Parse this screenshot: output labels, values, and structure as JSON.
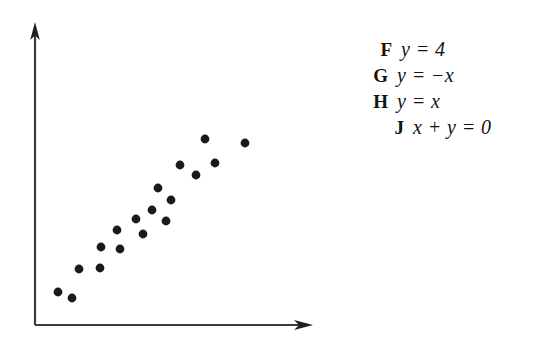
{
  "question": {
    "figure_label": "scatterplot-of-positively-correlated-data"
  },
  "choices": [
    {
      "letter": "F",
      "expression": "y = 4",
      "name": "choice-f"
    },
    {
      "letter": "G",
      "expression": "y = −x",
      "name": "choice-g"
    },
    {
      "letter": "H",
      "expression": "y = x",
      "name": "choice-h"
    },
    {
      "letter": "J",
      "expression": "x + y = 0",
      "name": "choice-j"
    }
  ],
  "colors": {
    "ink": "#131313",
    "axis": "#3a3a3a",
    "background": "#ffffff",
    "point_fill": "#1a1a1a"
  },
  "chart_data": {
    "type": "scatter",
    "title": "",
    "xlabel": "",
    "ylabel": "",
    "grid": false,
    "legend": "none",
    "axes": {
      "origin_px": [
        35,
        325
      ],
      "x_axis_end_px": [
        312,
        325
      ],
      "y_axis_end_px": [
        35,
        25
      ],
      "x_arrow": true,
      "y_arrow": true,
      "ticks": [],
      "tick_labels": []
    },
    "xlim": [
      0,
      10
    ],
    "ylim": [
      0,
      10
    ],
    "n_points": 18,
    "relationship": "positive linear correlation",
    "points_px": [
      [
        58,
        292
      ],
      [
        72,
        298
      ],
      [
        79,
        269
      ],
      [
        100,
        268
      ],
      [
        101,
        247
      ],
      [
        117,
        230
      ],
      [
        120,
        249
      ],
      [
        136,
        219
      ],
      [
        143,
        234
      ],
      [
        152,
        210
      ],
      [
        158,
        188
      ],
      [
        166,
        221
      ],
      [
        171,
        200
      ],
      [
        180,
        165
      ],
      [
        196,
        175
      ],
      [
        205,
        139
      ],
      [
        215,
        163
      ],
      [
        245,
        143
      ]
    ],
    "x": [
      0.83,
      1.34,
      1.59,
      2.35,
      2.38,
      2.96,
      3.07,
      3.65,
      3.9,
      4.23,
      4.44,
      4.73,
      4.91,
      5.23,
      5.81,
      6.14,
      6.5,
      7.59
    ],
    "y": [
      1.1,
      0.9,
      1.87,
      1.9,
      2.6,
      3.17,
      2.53,
      3.53,
      3.03,
      3.83,
      4.57,
      4.13,
      4.17,
      5.33,
      5.0,
      6.2,
      5.4,
      6.07
    ]
  }
}
